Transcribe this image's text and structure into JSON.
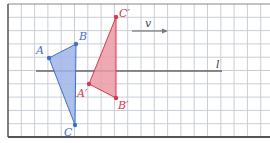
{
  "diagram": {
    "colors": {
      "grid": "#c9ced6",
      "border": "#555555",
      "original": "#3f6fc9",
      "original_fill": "#9fb5e8",
      "image": "#d23a4f",
      "image_fill": "#eb9aa5",
      "line": "#666666"
    },
    "original_triangle": {
      "vertices": [
        {
          "label": "A",
          "x": 49,
          "y": 58
        },
        {
          "label": "B",
          "x": 76,
          "y": 44
        },
        {
          "label": "C",
          "x": 75,
          "y": 125
        }
      ]
    },
    "image_triangle": {
      "vertices": [
        {
          "label": "A′",
          "x": 89,
          "y": 84
        },
        {
          "label": "B′",
          "x": 116,
          "y": 98
        },
        {
          "label": "C′",
          "x": 116,
          "y": 17
        }
      ]
    },
    "line": {
      "label": "l",
      "x1": 36,
      "y1": 71,
      "x2": 222,
      "y2": 71
    },
    "vector": {
      "label": "v",
      "x1": 132,
      "y1": 31,
      "x2": 168,
      "y2": 31
    }
  }
}
